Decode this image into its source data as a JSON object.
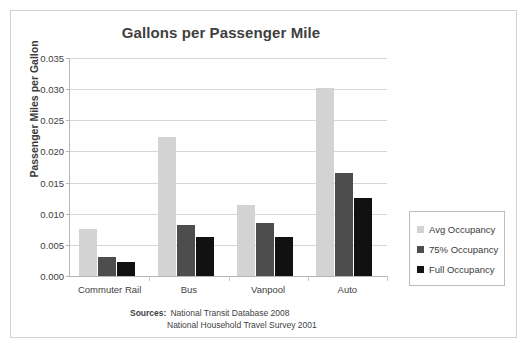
{
  "chart_data": {
    "type": "bar",
    "title": "Gallons per Passenger Mile",
    "xlabel": "",
    "ylabel": "Passenger Miles per Gallon",
    "categories": [
      "Commuter Rail",
      "Bus",
      "Vanpool",
      "Auto"
    ],
    "series": [
      {
        "name": "Avg Occupancy",
        "color": "#d3d3d3",
        "values": [
          0.0076,
          0.0223,
          0.0114,
          0.0302
        ]
      },
      {
        "name": "75% Occupancy",
        "color": "#4d4d4d",
        "values": [
          0.003,
          0.0082,
          0.0085,
          0.0165
        ]
      },
      {
        "name": "Full Occupancy",
        "color": "#111111",
        "values": [
          0.0022,
          0.0062,
          0.0063,
          0.0125
        ]
      }
    ],
    "ylim": [
      0.0,
      0.035
    ],
    "ytick_values": [
      0.0,
      0.005,
      0.01,
      0.015,
      0.02,
      0.025,
      0.03,
      0.035
    ],
    "ytick_labels": [
      "0.000",
      "0.005",
      "0.010",
      "0.015",
      "0.020",
      "0.025",
      "0.030",
      "0.035"
    ],
    "grid": true,
    "legend_position": "right"
  },
  "legend": {
    "items": [
      {
        "label": "Avg Occupancy",
        "color": "#d3d3d3"
      },
      {
        "label": "75% Occupancy",
        "color": "#4d4d4d"
      },
      {
        "label": "Full Occupancy",
        "color": "#111111"
      }
    ]
  },
  "sources": {
    "label": "Sources:",
    "line1": "National Transit Database 2008",
    "line2": "National Household Travel Survey 2001"
  }
}
